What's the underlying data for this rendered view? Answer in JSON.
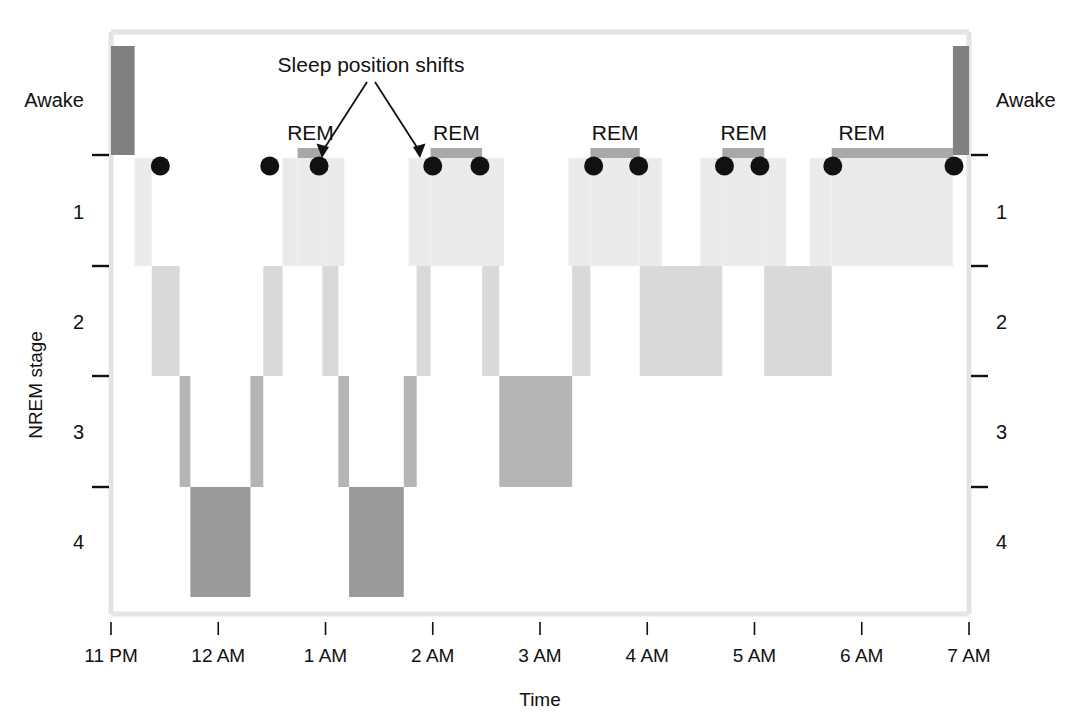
{
  "chart_data": {
    "type": "area",
    "title": "",
    "xlabel": "Time",
    "ylabel": "NREM stage",
    "x_tick_labels": [
      "11 PM",
      "12 AM",
      "1 AM",
      "2 AM",
      "3 AM",
      "4 AM",
      "5 AM",
      "6 AM",
      "7 AM"
    ],
    "x_tick_hours": [
      0,
      1,
      2,
      3,
      4,
      5,
      6,
      7,
      8
    ],
    "xlim_hours": [
      0,
      8
    ],
    "y_stage_labels_left": [
      "Awake",
      "1",
      "2",
      "3",
      "4"
    ],
    "y_stage_labels_right": [
      "Awake",
      "1",
      "2",
      "3",
      "4"
    ],
    "y_tick_count": 4,
    "grid": false,
    "legend": "none",
    "series_labels": [
      "REM",
      "REM",
      "REM",
      "REM",
      "REM"
    ],
    "annotation": "Sleep position shifts",
    "stage_levels": [
      "Awake",
      "REM",
      "1",
      "2",
      "3",
      "4"
    ],
    "colors": {
      "awake": "#808080",
      "rem": "#a8a8a8",
      "stage1": "#ebebeb",
      "stage2": "#d9d9d9",
      "stage3": "#b5b5b5",
      "stage4": "#9a9a9a",
      "marker": "#111111",
      "frame": "#e2e2e2",
      "text": "#111111"
    },
    "segments": [
      {
        "stage": "Awake",
        "start_h": 0.0,
        "end_h": 0.22
      },
      {
        "stage": "1",
        "start_h": 0.22,
        "end_h": 0.38
      },
      {
        "stage": "2",
        "start_h": 0.38,
        "end_h": 0.64
      },
      {
        "stage": "3",
        "start_h": 0.64,
        "end_h": 0.74
      },
      {
        "stage": "4",
        "start_h": 0.74,
        "end_h": 1.3
      },
      {
        "stage": "3",
        "start_h": 1.3,
        "end_h": 1.42
      },
      {
        "stage": "2",
        "start_h": 1.42,
        "end_h": 1.6
      },
      {
        "stage": "1",
        "start_h": 1.6,
        "end_h": 1.74
      },
      {
        "stage": "REM",
        "start_h": 1.74,
        "end_h": 1.97
      },
      {
        "stage": "2",
        "start_h": 1.97,
        "end_h": 2.12
      },
      {
        "stage": "3",
        "start_h": 2.12,
        "end_h": 2.22
      },
      {
        "stage": "4",
        "start_h": 2.22,
        "end_h": 2.73
      },
      {
        "stage": "3",
        "start_h": 2.73,
        "end_h": 2.85
      },
      {
        "stage": "2",
        "start_h": 2.85,
        "end_h": 2.98
      },
      {
        "stage": "REM",
        "start_h": 2.98,
        "end_h": 3.46
      },
      {
        "stage": "2",
        "start_h": 3.46,
        "end_h": 3.62
      },
      {
        "stage": "3",
        "start_h": 3.62,
        "end_h": 4.3
      },
      {
        "stage": "2",
        "start_h": 4.3,
        "end_h": 4.47
      },
      {
        "stage": "REM",
        "start_h": 4.47,
        "end_h": 4.93
      },
      {
        "stage": "2",
        "start_h": 4.93,
        "end_h": 5.7
      },
      {
        "stage": "REM",
        "start_h": 5.7,
        "end_h": 6.09
      },
      {
        "stage": "2",
        "start_h": 6.09,
        "end_h": 6.72
      },
      {
        "stage": "REM",
        "start_h": 6.72,
        "end_h": 7.85
      },
      {
        "stage": "Awake",
        "start_h": 7.85,
        "end_h": 8.0
      }
    ],
    "position_shift_markers_h": [
      0.46,
      1.48,
      1.94,
      3.0,
      3.44,
      4.5,
      4.92,
      5.72,
      6.05,
      6.73,
      7.86
    ],
    "rem_labels": [
      {
        "text": "REM",
        "center_h": 1.86
      },
      {
        "text": "REM",
        "center_h": 3.22
      },
      {
        "text": "REM",
        "center_h": 4.7
      },
      {
        "text": "REM",
        "center_h": 5.9
      },
      {
        "text": "REM",
        "center_h": 7.0
      }
    ]
  },
  "axes": {
    "y_title": "NREM stage",
    "x_title": "Time"
  },
  "annotation": {
    "text": "Sleep position shifts"
  }
}
